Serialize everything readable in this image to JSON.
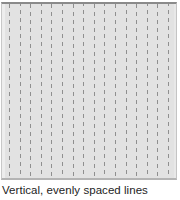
{
  "figure": {
    "caption": "Vertical, evenly spaced lines",
    "swatch": {
      "name": "vertical-dashed-line-pattern",
      "background_color": "#e2e2e2",
      "line_color": "#8f8f8f",
      "border_top_color": "#8a8a8a",
      "border_bottom_color": "#b4b4b4",
      "line_count": 16,
      "line_spacing_px": 10.6,
      "first_line_offset_px": 7,
      "line_width_px": 1,
      "dash_length_px": 4,
      "dash_gap_px": 4,
      "orientation": "vertical",
      "box_width_px": 176,
      "box_height_px": 178
    }
  },
  "chart_data": {
    "type": "pattern-swatch",
    "title": "Vertical, evenly spaced lines",
    "pattern": "vertical dashed lines",
    "orientation": "vertical",
    "line_count": 16,
    "spacing_px": 10.6,
    "dash_on_px": 4,
    "dash_off_px": 4,
    "line_color": "#8f8f8f",
    "background_color": "#e2e2e2",
    "xlabel": "",
    "ylabel": "",
    "grid": false,
    "legend": null
  }
}
